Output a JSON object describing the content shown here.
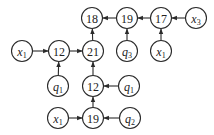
{
  "diagram": {
    "type": "directed-tree",
    "nodes": [
      {
        "id": "n18",
        "label": "18",
        "kind": "num",
        "x": 92,
        "y": 18
      },
      {
        "id": "n19a",
        "label": "19",
        "kind": "num",
        "x": 127,
        "y": 18
      },
      {
        "id": "n17",
        "label": "17",
        "kind": "num",
        "x": 161,
        "y": 18
      },
      {
        "id": "x3",
        "label": "x",
        "sub": "3",
        "kind": "var",
        "x": 196,
        "y": 18
      },
      {
        "id": "x1a",
        "label": "x",
        "sub": "1",
        "kind": "var",
        "x": 22,
        "y": 51
      },
      {
        "id": "n12a",
        "label": "12",
        "kind": "num",
        "x": 59,
        "y": 51
      },
      {
        "id": "n21",
        "label": "21",
        "kind": "num",
        "x": 93,
        "y": 51
      },
      {
        "id": "q3",
        "label": "q",
        "sub": "3",
        "kind": "var",
        "x": 127,
        "y": 51
      },
      {
        "id": "x1b",
        "label": "x",
        "sub": "1",
        "kind": "var",
        "x": 161,
        "y": 51
      },
      {
        "id": "q1a",
        "label": "q",
        "sub": "1",
        "kind": "var",
        "x": 58,
        "y": 86
      },
      {
        "id": "n12b",
        "label": "12",
        "kind": "num",
        "x": 93,
        "y": 86
      },
      {
        "id": "q1b",
        "label": "q",
        "sub": "1",
        "kind": "var",
        "x": 129,
        "y": 86
      },
      {
        "id": "x1c",
        "label": "x",
        "sub": "1",
        "kind": "var",
        "x": 58,
        "y": 118
      },
      {
        "id": "n19b",
        "label": "19",
        "kind": "num",
        "x": 93,
        "y": 118
      },
      {
        "id": "q2",
        "label": "q",
        "sub": "2",
        "kind": "var",
        "x": 130,
        "y": 118
      }
    ],
    "edges": [
      {
        "from": "n19a",
        "to": "n18"
      },
      {
        "from": "n17",
        "to": "n19a"
      },
      {
        "from": "x3",
        "to": "n17"
      },
      {
        "from": "q3",
        "to": "n19a"
      },
      {
        "from": "x1b",
        "to": "n17"
      },
      {
        "from": "n21",
        "to": "n18"
      },
      {
        "from": "x1a",
        "to": "n12a"
      },
      {
        "from": "n12a",
        "to": "n21"
      },
      {
        "from": "q1a",
        "to": "n12a"
      },
      {
        "from": "n12b",
        "to": "n21"
      },
      {
        "from": "q1b",
        "to": "n12b"
      },
      {
        "from": "n19b",
        "to": "n12b"
      },
      {
        "from": "x1c",
        "to": "n19b"
      },
      {
        "from": "q2",
        "to": "n19b"
      }
    ],
    "radius": 10.5,
    "colors": {
      "stroke": "#2a2a2a",
      "fill": "#ffffff",
      "text": "#222222"
    }
  }
}
